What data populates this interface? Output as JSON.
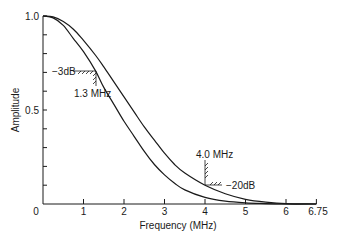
{
  "chart_data": {
    "type": "line",
    "title": "",
    "xlabel": "Frequency (MHz)",
    "ylabel": "Amplitude",
    "xlim": [
      0,
      6.75
    ],
    "ylim": [
      0,
      1.0
    ],
    "grid": false,
    "legend": null,
    "x_ticks": [
      0,
      1,
      2,
      3,
      4,
      5,
      6,
      6.75
    ],
    "x_tick_labels": [
      "0",
      "1",
      "2",
      "3",
      "4",
      "5",
      "6",
      "6.75"
    ],
    "y_ticks": [
      0,
      0.1,
      0.2,
      0.3,
      0.4,
      0.5,
      0.6,
      0.7,
      0.8,
      0.9,
      1.0
    ],
    "y_tick_labels": {
      "0": "0",
      "0.5": "0.5",
      "1.0": "1.0"
    },
    "series": [
      {
        "name": "narrow-response",
        "x": [
          0,
          0.25,
          0.5,
          0.75,
          1.0,
          1.3,
          1.5,
          1.75,
          2.0,
          2.25,
          2.5,
          2.75,
          3.0,
          3.25,
          3.5,
          4.0,
          4.5,
          5.0,
          5.5,
          6.0,
          6.75
        ],
        "values": [
          1.0,
          0.99,
          0.95,
          0.88,
          0.81,
          0.707,
          0.62,
          0.53,
          0.44,
          0.36,
          0.28,
          0.21,
          0.155,
          0.11,
          0.075,
          0.035,
          0.015,
          0.006,
          0.002,
          0.0,
          0.0
        ]
      },
      {
        "name": "wide-response",
        "x": [
          0,
          0.25,
          0.5,
          0.75,
          1.0,
          1.3,
          1.5,
          1.75,
          2.0,
          2.25,
          2.5,
          2.75,
          3.0,
          3.25,
          3.5,
          4.0,
          4.5,
          5.0,
          5.5,
          6.0,
          6.75
        ],
        "values": [
          1.0,
          0.995,
          0.97,
          0.93,
          0.87,
          0.79,
          0.73,
          0.65,
          0.57,
          0.49,
          0.41,
          0.34,
          0.27,
          0.21,
          0.165,
          0.1,
          0.055,
          0.025,
          0.01,
          0.002,
          0.0
        ]
      }
    ],
    "annotations": [
      {
        "text": "−3dB",
        "x": 1.3,
        "y": 0.707
      },
      {
        "text": "1.3 MHz",
        "x": 1.3,
        "y": 0.707
      },
      {
        "text": "4.0 MHz",
        "x": 4.0,
        "y": 0.1
      },
      {
        "text": "−20dB",
        "x": 4.0,
        "y": 0.1
      }
    ]
  },
  "labels": {
    "xlabel": "Frequency (MHz)",
    "ylabel": "Amplitude",
    "y_top": "1.0",
    "y_mid": "0.5",
    "origin": "0",
    "x1": "1",
    "x2": "2",
    "x3": "3",
    "x4": "4",
    "x5": "5",
    "x6": "6",
    "x675": "6.75",
    "ann_3db": "−3dB",
    "ann_13": "1.3 MHz",
    "ann_40": "4.0 MHz",
    "ann_20db": "−20dB"
  }
}
